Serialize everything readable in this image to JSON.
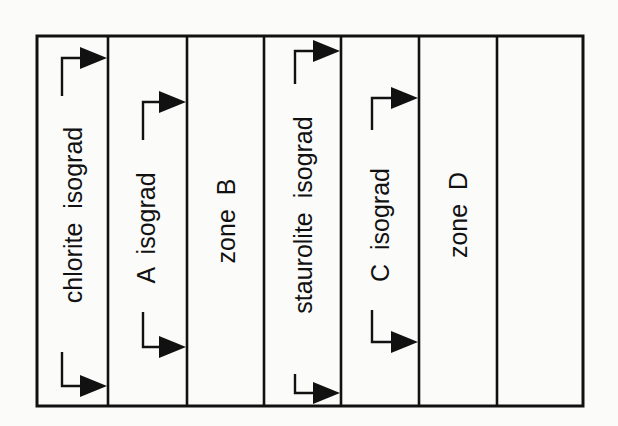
{
  "diagram": {
    "frame": {
      "left": 37,
      "top": 36,
      "right": 583,
      "bottom": 406,
      "stroke": "#111111",
      "stroke_width": 3
    },
    "dividers_x": [
      108,
      187,
      264,
      341,
      419,
      497
    ],
    "columns": [
      {
        "id": "col-1",
        "label": "chlorite  isograd",
        "type": "isograd",
        "center_x": 73,
        "center_y": 215,
        "bracket_x": 62,
        "arrow_top_y": 58,
        "arrow_bottom_y": 386,
        "text_top": 96,
        "text_bottom": 352
      },
      {
        "id": "col-2",
        "label": "A  isograd",
        "type": "isograd",
        "center_x": 146,
        "center_y": 228,
        "bracket_x": 143,
        "arrow_top_y": 102,
        "arrow_bottom_y": 347,
        "text_top": 140,
        "text_bottom": 312
      },
      {
        "id": "col-3",
        "label": "zone  B",
        "type": "zone",
        "center_x": 226,
        "center_y": 221
      },
      {
        "id": "col-4",
        "label": "staurolite  isograd",
        "type": "isograd",
        "center_x": 303,
        "center_y": 215,
        "bracket_x": 295,
        "arrow_top_y": 51,
        "arrow_bottom_y": 393,
        "text_top": 84,
        "text_bottom": 374
      },
      {
        "id": "col-5",
        "label": "C  isograd",
        "type": "isograd",
        "center_x": 380,
        "center_y": 225,
        "bracket_x": 372,
        "arrow_top_y": 98,
        "arrow_bottom_y": 342,
        "text_top": 130,
        "text_bottom": 310
      },
      {
        "id": "col-6",
        "label": "zone  D",
        "type": "zone",
        "center_x": 458,
        "center_y": 215
      },
      {
        "id": "col-7",
        "label": "",
        "type": "empty",
        "center_x": 540,
        "center_y": 221
      }
    ],
    "colors": {
      "ink": "#111111",
      "background": "#fbfbfa"
    }
  }
}
